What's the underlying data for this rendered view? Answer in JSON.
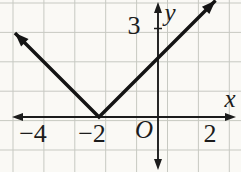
{
  "figure": {
    "colors": {
      "background": "#faf9f5",
      "grid": "#c7c9c2",
      "axis": "#1c1c1c",
      "curve": "#141414",
      "text": "#1c1c1c"
    }
  },
  "chart_data": {
    "type": "line",
    "function": "y = |x + 2|",
    "vertex": [
      -2,
      0
    ],
    "slope_left": -1,
    "slope_right": 1,
    "series": [
      {
        "name": "y = |x + 2|",
        "points": [
          [
            -4.85,
            2.85
          ],
          [
            -2,
            0
          ],
          [
            1.95,
            3.95
          ]
        ],
        "arrow_both_ends": true
      }
    ],
    "x_tick_labels": [
      {
        "value": -4,
        "label": "−4"
      },
      {
        "value": -2,
        "label": "−2"
      },
      {
        "value": 2,
        "label": "2"
      }
    ],
    "y_tick_labels": [
      {
        "value": 3,
        "label": "3"
      }
    ],
    "xlabel": "x",
    "ylabel": "y",
    "origin_label": "O",
    "xlim": [
      -4.95,
      2.65
    ],
    "ylim": [
      -1.85,
      3.9
    ],
    "grid": true,
    "legend": false,
    "arrows": [
      "x-axis both ends",
      "y-axis both ends",
      "curve both ends"
    ]
  }
}
